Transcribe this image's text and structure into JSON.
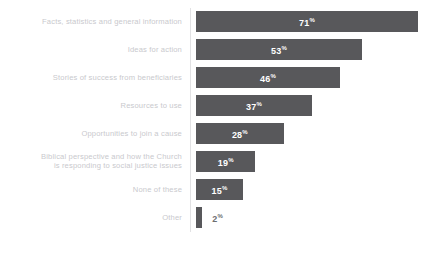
{
  "chart_data": {
    "type": "bar",
    "orientation": "horizontal",
    "title": "",
    "subtitle": "",
    "xlabel": "",
    "ylabel": "",
    "xlim": [
      0,
      71
    ],
    "grid": false,
    "legend": null,
    "value_suffix": "%",
    "bar_color": "#58585b",
    "label_color": "#c9c9cd",
    "value_label_color_inside": "#ffffff",
    "value_label_color_outside": "#6d6d70",
    "axis_line_color": "#e2e2e4",
    "background_color": "#ffffff",
    "categories": [
      "Facts, statistics and general information",
      "Ideas for action",
      "Stories of success from beneficiaries",
      "Resources to use",
      "Opportunities to join a cause",
      "Biblical perspective and how the Church\nis responding to social justice issues",
      "None of these",
      "Other"
    ],
    "values": [
      71,
      53,
      46,
      37,
      28,
      19,
      15,
      2
    ],
    "value_labels": [
      "71",
      "53",
      "46",
      "37",
      "28",
      "19",
      "15",
      "2"
    ],
    "value_label_placement": [
      "inside",
      "inside",
      "inside",
      "inside",
      "inside",
      "inside",
      "inside",
      "outside"
    ]
  }
}
